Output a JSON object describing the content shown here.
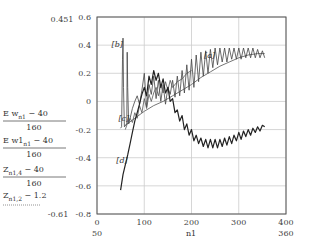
{
  "chart_data": {
    "type": "line",
    "title": "",
    "xlabel": "n1",
    "xlim": [
      0,
      400
    ],
    "ylim": [
      -0.8,
      0.6
    ],
    "grid": true,
    "x_ticks": [
      "0",
      "100",
      "200",
      "300",
      "400"
    ],
    "y_ticks": [
      "-0.8",
      "-0.6",
      "-0.4",
      "-0.2",
      "0",
      "0.2",
      "0.4",
      "0.6"
    ],
    "x_range_labels": {
      "min": "50",
      "max": "360"
    },
    "y_range_labels": {
      "max": "0.451",
      "min": "-0.61"
    },
    "legend": [
      {
        "label": "Ew_n1 - 40",
        "num_main": "E w",
        "num_sub": "n1",
        "num_tail": " − 40",
        "den": "160"
      },
      {
        "label": "Ew1_n1 - 40",
        "num_main": "E w1",
        "num_sub": "n1",
        "num_tail": " − 40",
        "den": "160"
      },
      {
        "label": "Z_n1,4 - 40",
        "num_main": "Z",
        "num_sub": "n1,4",
        "num_tail": " − 40",
        "den": "160"
      },
      {
        "label": "Z_n1,2 - 1.2",
        "num_main": "Z",
        "num_sub": "n1,2",
        "num_tail": " − 1.2",
        "den": ""
      }
    ],
    "annotations": [
      {
        "text": "[b]",
        "x": 55,
        "y": 0.39
      },
      {
        "text": "[a]",
        "x": 250,
        "y": 0.31
      },
      {
        "text": "[c]",
        "x": 68,
        "y": -0.14
      },
      {
        "text": "[d]",
        "x": 65,
        "y": -0.44
      }
    ],
    "series": [
      {
        "name": "[a] smooth rising",
        "x": [
          60,
          80,
          100,
          120,
          140,
          160,
          180,
          200,
          220,
          240,
          260,
          280,
          300,
          320,
          340,
          355
        ],
        "y": [
          -0.17,
          -0.12,
          -0.07,
          -0.03,
          0.0,
          0.04,
          0.08,
          0.12,
          0.17,
          0.21,
          0.25,
          0.28,
          0.31,
          0.33,
          0.34,
          0.34
        ]
      },
      {
        "name": "[b] spiky oscillating",
        "x": [
          50,
          52,
          54,
          55,
          56,
          58,
          60,
          63,
          64,
          65,
          67,
          70,
          75,
          80,
          85,
          90,
          95,
          100,
          105,
          110,
          115,
          120,
          125,
          130,
          135,
          140,
          145,
          150,
          155,
          160,
          165,
          170,
          175,
          180,
          185,
          190,
          195,
          200,
          205,
          210,
          215,
          220,
          225,
          230,
          235,
          240,
          245,
          250,
          255,
          260,
          265,
          270,
          275,
          280,
          285,
          290,
          295,
          300,
          305,
          310,
          315,
          320,
          325,
          330,
          335,
          340,
          345,
          350,
          355
        ],
        "y": [
          -0.19,
          -0.18,
          0.3,
          0.45,
          0.1,
          -0.18,
          -0.17,
          -0.16,
          0.35,
          0.1,
          -0.16,
          -0.12,
          -0.05,
          0.0,
          0.04,
          -0.02,
          0.08,
          0.2,
          -0.04,
          0.12,
          0.05,
          0.18,
          0.02,
          0.15,
          0.0,
          0.12,
          -0.02,
          0.1,
          0.05,
          0.15,
          0.03,
          0.18,
          0.04,
          0.22,
          0.06,
          0.26,
          0.08,
          0.3,
          0.1,
          0.33,
          0.14,
          0.35,
          0.18,
          0.36,
          0.2,
          0.37,
          0.24,
          0.38,
          0.26,
          0.38,
          0.28,
          0.38,
          0.28,
          0.38,
          0.3,
          0.38,
          0.3,
          0.38,
          0.3,
          0.38,
          0.31,
          0.38,
          0.31,
          0.38,
          0.31,
          0.37,
          0.31,
          0.36,
          0.31
        ]
      },
      {
        "name": "[c] rising irregular",
        "x": [
          60,
          65,
          70,
          75,
          80,
          85,
          90,
          95,
          100,
          105,
          110,
          115,
          120,
          125,
          130,
          135,
          140,
          145,
          150,
          155,
          160,
          170,
          180,
          190,
          200
        ],
        "y": [
          -0.2,
          -0.15,
          -0.12,
          -0.15,
          -0.08,
          -0.12,
          -0.03,
          -0.08,
          0.02,
          -0.05,
          0.05,
          0.0,
          0.06,
          0.1,
          0.04,
          0.12,
          0.06,
          0.14,
          0.08,
          0.15,
          0.1,
          0.14,
          0.16,
          0.2,
          0.22
        ]
      },
      {
        "name": "[d] rise then fall",
        "x": [
          50,
          55,
          60,
          65,
          70,
          75,
          80,
          85,
          90,
          95,
          100,
          105,
          110,
          115,
          120,
          125,
          130,
          135,
          140,
          145,
          150,
          155,
          160,
          165,
          170,
          175,
          180,
          185,
          190,
          195,
          200,
          205,
          210,
          215,
          220,
          225,
          230,
          235,
          240,
          245,
          250,
          255,
          260,
          265,
          270,
          275,
          280,
          285,
          290,
          295,
          300,
          305,
          310,
          315,
          320,
          325,
          330,
          335,
          340,
          345,
          350,
          355
        ],
        "y": [
          -0.63,
          -0.52,
          -0.45,
          -0.38,
          -0.3,
          -0.22,
          -0.14,
          -0.08,
          -0.02,
          0.05,
          0.1,
          0.04,
          0.18,
          0.12,
          0.22,
          0.15,
          0.2,
          0.1,
          0.16,
          0.06,
          0.1,
          0.0,
          0.02,
          -0.08,
          -0.06,
          -0.14,
          -0.1,
          -0.2,
          -0.16,
          -0.24,
          -0.2,
          -0.28,
          -0.24,
          -0.3,
          -0.26,
          -0.32,
          -0.27,
          -0.33,
          -0.27,
          -0.33,
          -0.27,
          -0.33,
          -0.27,
          -0.32,
          -0.26,
          -0.31,
          -0.25,
          -0.3,
          -0.24,
          -0.28,
          -0.22,
          -0.27,
          -0.21,
          -0.25,
          -0.2,
          -0.24,
          -0.19,
          -0.22,
          -0.18,
          -0.21,
          -0.17,
          -0.18
        ]
      }
    ]
  }
}
